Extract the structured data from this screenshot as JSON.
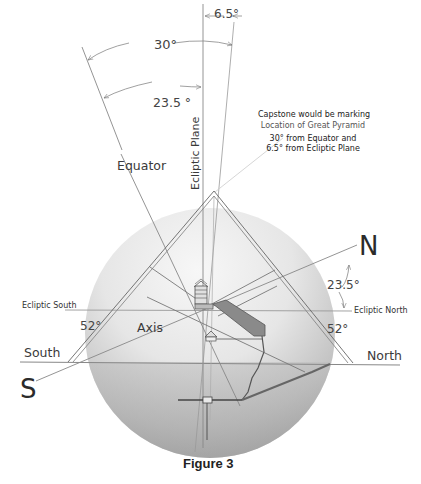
{
  "figure": {
    "caption": "Figure 3",
    "annotation": {
      "line1": "Capstone would be marking",
      "line2": "Location of Great Pyramid",
      "line3": "30° from Equator and",
      "line4": "6.5° from Ecliptic Plane"
    },
    "labels": {
      "equator": "Equator",
      "ecliptic_plane": "Ecliptic Plane",
      "axis": "Axis",
      "north_pole": "N",
      "south_pole": "S",
      "north": "North",
      "south": "South",
      "ecliptic_north": "Ecliptic North",
      "ecliptic_south": "Ecliptic South"
    },
    "angles": {
      "capstone_to_ecliptic": "6.5°",
      "capstone_to_equator": "30°",
      "equator_to_ecliptic": "23.5 °",
      "axis_tilt": "23.5°",
      "pyramid_slope_left": "52°",
      "pyramid_slope_right": "52°"
    },
    "colors": {
      "line": "#777777",
      "dark_line": "#555555",
      "sphere_light": "#f2f2f2",
      "sphere_dark": "#9a9a9a",
      "text": "#333333"
    }
  }
}
